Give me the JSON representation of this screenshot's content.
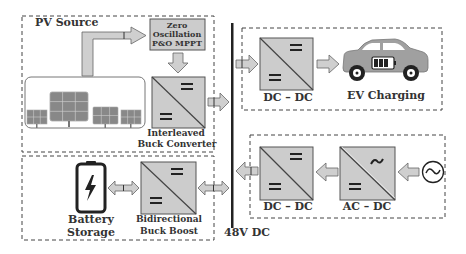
{
  "colors": {
    "block_fill": "#cccccc",
    "block_stroke": "#555555",
    "arrow_fill": "#cfcfcf",
    "bus_line": "#222222",
    "dashed_border": "#444444",
    "text": "#333333",
    "car_body": "#a0a0a0",
    "battery_outline": "#222222"
  },
  "pv_section": {
    "label": "PV Source",
    "mppt": {
      "line1": "Zero",
      "line2": "Oscillation",
      "line3": "P&O MPPT"
    },
    "converter": {
      "line1": "Interleaved",
      "line2": "Buck Converter",
      "top_symbol": "DC",
      "bottom_symbol": "DC"
    },
    "solar_panels_icon": "solar-panel-array"
  },
  "battery_section": {
    "battery_label": {
      "line1": "Battery",
      "line2": "Storage"
    },
    "battery_icon": "battery-lightning",
    "converter": {
      "line1": "Bidirectional",
      "line2": "Buck Boost",
      "top_symbol": "DC",
      "bottom_symbol": "DC"
    }
  },
  "bus": {
    "label": "48V DC"
  },
  "ev_section": {
    "converter_label": "DC – DC",
    "load_label": "EV Charging",
    "car_icon": "electric-car"
  },
  "grid_section": {
    "dcdc_label": "DC – DC",
    "acdc_label": "AC – DC",
    "source_icon": "ac-source"
  }
}
